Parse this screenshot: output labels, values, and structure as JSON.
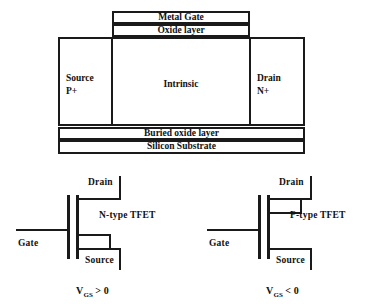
{
  "figure": {
    "cross_section": {
      "gate_stack": {
        "metal_gate_label": "Metal Gate",
        "oxide_layer_label": "Oxide layer"
      },
      "body_regions": [
        {
          "name": "source",
          "line1": "Source",
          "line2": "P+"
        },
        {
          "name": "intrinsic",
          "line1": "Intrinsic",
          "line2": ""
        },
        {
          "name": "drain",
          "line1": "Drain",
          "line2": "N+"
        }
      ],
      "substrate_layers": [
        {
          "name": "buried-oxide-layer",
          "label": "Buried oxide layer"
        },
        {
          "name": "silicon-substrate",
          "label": "Silicon Substrate"
        }
      ]
    },
    "symbols": [
      {
        "id": "n-type",
        "type_label": "N-type TFET",
        "gate_label": "Gate",
        "drain_label": "Drain",
        "source_label": "Source",
        "bias_symbol": "V",
        "bias_subscript": "GS",
        "bias_relation": "> 0"
      },
      {
        "id": "p-type",
        "type_label": "P-type TFET",
        "gate_label": "Gate",
        "drain_label": "Drain",
        "source_label": "Source",
        "bias_symbol": "V",
        "bias_subscript": "GS",
        "bias_relation": "< 0"
      }
    ],
    "colors": {
      "line": "#1a1a1a",
      "background": "#ffffff"
    }
  }
}
